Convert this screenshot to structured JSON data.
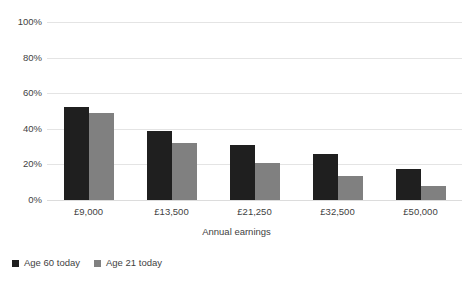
{
  "chart_data": {
    "type": "bar",
    "title": "",
    "subtitle": "",
    "xlabel": "Annual earnings",
    "ylabel": "",
    "categories": [
      "£9,000",
      "£13,500",
      "£21,250",
      "£32,500",
      "£50,000"
    ],
    "series": [
      {
        "name": "Age 60 today",
        "color": "#1f1f1f",
        "values": [
          52,
          39,
          31,
          26,
          17.5
        ]
      },
      {
        "name": "Age 21 today",
        "color": "#808080",
        "values": [
          49,
          32,
          21,
          13.5,
          8
        ]
      }
    ],
    "ylim": [
      0,
      100
    ],
    "ytick_values": [
      100,
      80,
      60,
      40,
      20,
      0
    ],
    "ytick_labels": [
      "100%",
      "80%",
      "60%",
      "40%",
      "20%",
      "0%"
    ],
    "grid": true,
    "grid_color": "#e4e4e4",
    "legend_position": "bottom-left",
    "background": "#ffffff"
  }
}
